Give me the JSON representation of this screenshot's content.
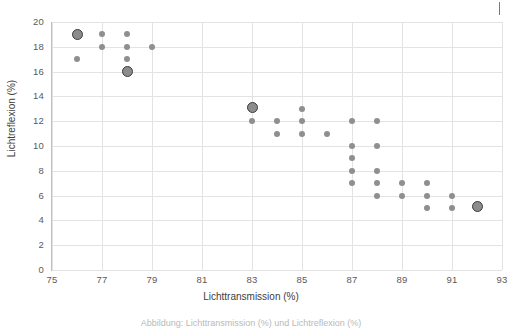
{
  "chart_data": {
    "type": "scatter",
    "title": "",
    "xlabel": "Lichttransmission (%)",
    "ylabel": "Lichtreflexion (%)",
    "xlim": [
      75,
      93
    ],
    "ylim": [
      0,
      20
    ],
    "xticks": [
      75,
      77,
      79,
      81,
      83,
      85,
      87,
      89,
      91,
      93
    ],
    "yticks": [
      0,
      2,
      4,
      6,
      8,
      10,
      12,
      14,
      16,
      18,
      20
    ],
    "grid": true,
    "legend": "none",
    "series": [
      {
        "name": "Messpunkte",
        "marker": "circle",
        "color": "#8e8e93",
        "points": [
          [
            76,
            17
          ],
          [
            77,
            19
          ],
          [
            77,
            18
          ],
          [
            78,
            19
          ],
          [
            78,
            18
          ],
          [
            78,
            17
          ],
          [
            79,
            18
          ],
          [
            83,
            12
          ],
          [
            84,
            12
          ],
          [
            84,
            11
          ],
          [
            85,
            13
          ],
          [
            85,
            12
          ],
          [
            85,
            11
          ],
          [
            86,
            11
          ],
          [
            87,
            12
          ],
          [
            87,
            10
          ],
          [
            87,
            9
          ],
          [
            87,
            8
          ],
          [
            87,
            7
          ],
          [
            88,
            12
          ],
          [
            88,
            10
          ],
          [
            88,
            8
          ],
          [
            88,
            7
          ],
          [
            88,
            6
          ],
          [
            89,
            7
          ],
          [
            89,
            6
          ],
          [
            90,
            7
          ],
          [
            90,
            6
          ],
          [
            90,
            5
          ],
          [
            91,
            6
          ],
          [
            91,
            5
          ]
        ]
      },
      {
        "name": "Hervorgehobene Punkte",
        "marker": "circle-outlined",
        "color": "#8c8c8c",
        "edge_color": "#3b3b3b",
        "points": [
          [
            76,
            19
          ],
          [
            78,
            16
          ],
          [
            83,
            13.1
          ],
          [
            92,
            5.1
          ]
        ]
      }
    ]
  },
  "axis": {
    "x_title": "Lichttransmission (%)",
    "y_title": "Lichtreflexion (%)",
    "x_ticks": [
      "75",
      "77",
      "79",
      "81",
      "83",
      "85",
      "87",
      "89",
      "91",
      "93"
    ],
    "y_ticks": [
      "20",
      "18",
      "16",
      "14",
      "12",
      "10",
      "8",
      "6",
      "4",
      "2",
      "0"
    ]
  },
  "caption": {
    "clipped_text": "Abbildung: Lichttransmission (%) und Lichtreflexion (%)"
  },
  "colors": {
    "marker": "#8e8e93",
    "marker_highlight_fill": "#8c8c8c",
    "marker_highlight_edge": "#3b3b3b",
    "grid": "#e3e3e3",
    "axis": "#bfbfbf",
    "text": "#5a5a5a"
  }
}
